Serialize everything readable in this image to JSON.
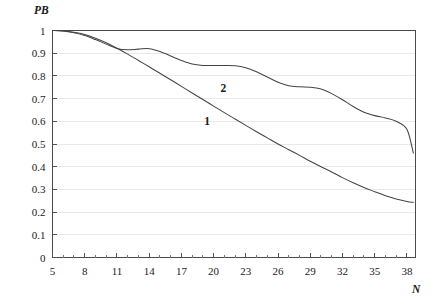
{
  "chart_data": {
    "type": "line",
    "title": "",
    "xlabel": "N",
    "ylabel": "PB",
    "xlim": [
      5,
      38.8
    ],
    "ylim": [
      0,
      1
    ],
    "grid": "horizontal",
    "legend": "inline-labels",
    "x_ticks_major": [
      5,
      8,
      11,
      14,
      17,
      20,
      23,
      26,
      29,
      32,
      35,
      38
    ],
    "x_tick_labels": [
      "5",
      "8",
      "11",
      "14",
      "17",
      "20",
      "23",
      "26",
      "29",
      "32",
      "35",
      "38"
    ],
    "x_ticks_minor_step": 1,
    "y_ticks_major": [
      0,
      0.1,
      0.2,
      0.3,
      0.4,
      0.5,
      0.6,
      0.7,
      0.8,
      0.9,
      1
    ],
    "y_tick_labels": [
      "0",
      "0.1",
      "0.2",
      "0.3",
      "0.4",
      "0.5",
      "0.6",
      "0.7",
      "0.8",
      "0.9",
      "1"
    ],
    "series": [
      {
        "name": "1",
        "label": "1",
        "label_x": 19.4,
        "label_y": 0.585,
        "color": "#444444",
        "x": [
          5,
          6,
          7,
          8,
          9,
          10,
          11,
          12,
          13,
          14,
          15,
          16,
          17,
          18,
          19,
          20,
          21,
          22,
          23,
          24,
          25,
          26,
          27,
          28,
          29,
          30,
          31,
          32,
          33,
          34,
          35,
          36,
          37,
          38,
          38.6
        ],
        "y": [
          1.0,
          0.998,
          0.992,
          0.982,
          0.966,
          0.946,
          0.922,
          0.896,
          0.868,
          0.84,
          0.812,
          0.783,
          0.754,
          0.725,
          0.696,
          0.667,
          0.638,
          0.61,
          0.582,
          0.554,
          0.527,
          0.5,
          0.475,
          0.45,
          0.424,
          0.4,
          0.377,
          0.352,
          0.329,
          0.308,
          0.29,
          0.272,
          0.258,
          0.247,
          0.243
        ]
      },
      {
        "name": "2",
        "label": "2",
        "label_x": 20.9,
        "label_y": 0.727,
        "color": "#444444",
        "x": [
          5,
          6,
          7,
          8,
          9,
          10,
          11,
          12,
          13,
          14,
          15,
          16,
          17,
          18,
          19,
          20,
          21,
          22,
          23,
          24,
          25,
          26,
          27,
          28,
          29,
          30,
          31,
          32,
          33,
          34,
          35,
          36,
          37,
          38,
          38.6
        ],
        "y": [
          1.0,
          0.998,
          0.99,
          0.978,
          0.96,
          0.94,
          0.921,
          0.915,
          0.918,
          0.92,
          0.908,
          0.888,
          0.868,
          0.852,
          0.846,
          0.846,
          0.846,
          0.845,
          0.836,
          0.818,
          0.795,
          0.772,
          0.757,
          0.752,
          0.75,
          0.742,
          0.722,
          0.695,
          0.665,
          0.64,
          0.625,
          0.615,
          0.6,
          0.565,
          0.46
        ]
      }
    ]
  }
}
